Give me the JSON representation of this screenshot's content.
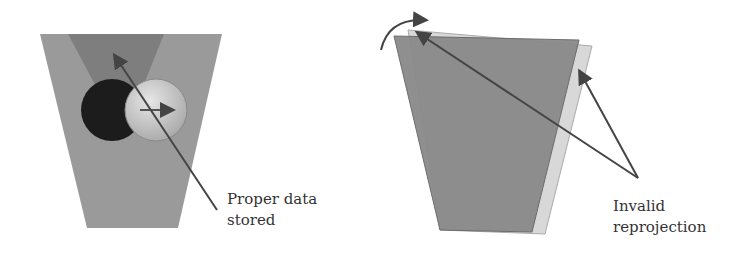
{
  "left_panel": {
    "label_line1": "Proper data",
    "label_line2": "stored"
  },
  "right_panel": {
    "label_line1": "Invalid",
    "label_line2": "reprojection"
  },
  "colors": {
    "frustum": "#9a9a9a",
    "inner_cone": "#7e7e7e",
    "dark_sphere": "#1e1e1e",
    "light_sphere": "#c8c8c8",
    "arrow": "#444444",
    "ghost_frustum": "#d6d6d6",
    "rotated_frustum": "#8a8a8a"
  }
}
